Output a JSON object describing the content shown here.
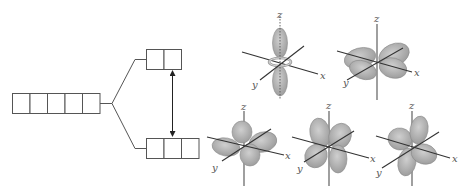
{
  "diagram": {
    "title": "",
    "colors": {
      "lobe_fill": "#a9a9a9",
      "lobe_light": "#cfcfcf",
      "line": "#555555",
      "axis": "#333333",
      "background": "#ffffff"
    },
    "energy_levels": {
      "degenerate": {
        "box_count": 5
      },
      "upper": {
        "box_count": 2
      },
      "lower": {
        "box_count": 3
      }
    },
    "splitting_arrow": {
      "type": "double-headed"
    },
    "orbitals": [
      {
        "id": "dz2",
        "shape": "dumbbell-with-torus",
        "labels": {
          "z": "z",
          "x": "x",
          "y": "y"
        }
      },
      {
        "id": "dxz-upper",
        "shape": "four-lobe-in-plane",
        "labels": {
          "z": "z",
          "x": "x",
          "y": "y"
        }
      },
      {
        "id": "lower-1",
        "shape": "four-lobe-cloverleaf",
        "labels": {
          "z": "z",
          "x": "x",
          "y": "y"
        }
      },
      {
        "id": "lower-2",
        "shape": "four-lobe-cloverleaf",
        "labels": {
          "z": "z",
          "x": "x",
          "y": "y"
        }
      },
      {
        "id": "lower-3",
        "shape": "four-lobe-cloverleaf",
        "labels": {
          "z": "z",
          "x": "x",
          "y": "y"
        }
      }
    ]
  }
}
